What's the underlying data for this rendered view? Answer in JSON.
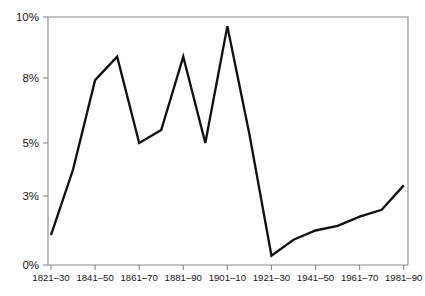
{
  "chart_data": {
    "type": "line",
    "title": "",
    "subtitle": "",
    "xlabel": "",
    "ylabel": "",
    "grid": false,
    "legend": "none",
    "line_color": "#121212",
    "axis_color": "#8c8c8c",
    "ylim": [
      0,
      10
    ],
    "y_ticks": [
      {
        "value": 0,
        "label": "0%"
      },
      {
        "value": 3,
        "label": "3%"
      },
      {
        "value": 5,
        "label": "5%"
      },
      {
        "value": 8,
        "label": "8%"
      },
      {
        "value": 10,
        "label": "10%"
      }
    ],
    "y_tick_labels": [
      "0%",
      "3%",
      "5%",
      "8%",
      "10%"
    ],
    "y_axis_scale": "nonlinear-irregular-ticks",
    "x_tick_labels": [
      "1821–30",
      "1841–50",
      "1861–70",
      "1881–90",
      "1901–10",
      "1921–30",
      "1941–50",
      "1961–70",
      "1981–90"
    ],
    "categories": [
      "1821–30",
      "1831–40",
      "1841–50",
      "1851–60",
      "1861–70",
      "1871–80",
      "1881–90",
      "1891–1900",
      "1901–10",
      "1911–20",
      "1921–30",
      "1931–40",
      "1941–50",
      "1951–60",
      "1961–70",
      "1971–80",
      "1981–90"
    ],
    "values": [
      1.3,
      4.0,
      7.9,
      8.7,
      5.0,
      5.6,
      8.7,
      5.0,
      9.7,
      5.4,
      0.4,
      1.1,
      1.5,
      1.7,
      2.1,
      2.4,
      3.4
    ],
    "series": [
      {
        "name": "rate",
        "values": [
          1.3,
          4.0,
          7.9,
          8.7,
          5.0,
          5.6,
          8.7,
          5.0,
          9.7,
          5.4,
          0.4,
          1.1,
          1.5,
          1.7,
          2.1,
          2.4,
          3.4
        ]
      }
    ],
    "annotations": []
  },
  "plot": {
    "left": 48,
    "right": 408,
    "top": 17,
    "bottom": 265
  }
}
